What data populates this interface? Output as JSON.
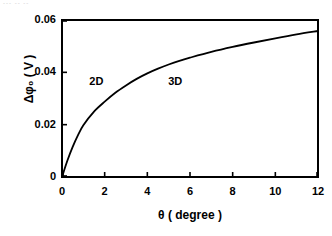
{
  "figure": {
    "artifact_text": "--- -- --",
    "background_color": "#ffffff",
    "ink_color": "#000000"
  },
  "chart_data": {
    "type": "line",
    "title": "",
    "subtitle": "",
    "xlabel": "θ ( degree )",
    "ylabel": "Δφ₀ ( V )",
    "xlim": [
      0,
      12
    ],
    "ylim": [
      0,
      0.06
    ],
    "grid": false,
    "legend": "none",
    "xticks": [
      0,
      2,
      4,
      6,
      8,
      10,
      12
    ],
    "xtick_labels": [
      "0",
      "2",
      "4",
      "6",
      "8",
      "10",
      "12"
    ],
    "yticks": [
      0,
      0.02,
      0.04,
      0.06
    ],
    "ytick_labels": [
      "0",
      "0.02",
      "0.04",
      "0.06"
    ],
    "tick_direction": "in",
    "series": [
      {
        "name": "delta-phi-0",
        "x": [
          0,
          0.25,
          0.5,
          0.75,
          1,
          1.5,
          2,
          2.5,
          3,
          3.5,
          4,
          4.5,
          5,
          5.5,
          6,
          7,
          8,
          9,
          10,
          11,
          12
        ],
        "y": [
          0,
          0.0062,
          0.0115,
          0.016,
          0.0198,
          0.025,
          0.0288,
          0.0322,
          0.035,
          0.0375,
          0.0396,
          0.0414,
          0.043,
          0.0444,
          0.0456,
          0.0478,
          0.0497,
          0.0514,
          0.053,
          0.0545,
          0.0558
        ]
      }
    ],
    "annotations": [
      {
        "text": "2D",
        "x": 1.7,
        "y": 0.0362
      },
      {
        "text": "3D",
        "x": 5.4,
        "y": 0.0362
      }
    ]
  }
}
